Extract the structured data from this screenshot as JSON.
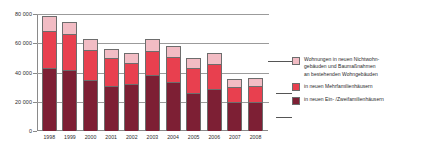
{
  "chart_data": {
    "type": "bar",
    "stacked": true,
    "title": "",
    "xlabel": "",
    "ylabel": "",
    "ylim": [
      0,
      80000
    ],
    "yticks": [
      0,
      20000,
      40000,
      60000,
      80000
    ],
    "ytick_labels": [
      "0",
      "20 000",
      "40 000",
      "60 000",
      "80 000"
    ],
    "grid": true,
    "legend_position": "right",
    "categories": [
      "1998",
      "1999",
      "2000",
      "2001",
      "2002",
      "2003",
      "2004",
      "2005",
      "2006",
      "2007",
      "2008"
    ],
    "series": [
      {
        "name": "in neuen Ein- /Zweifamilienhäusern",
        "color": "#7d1f34",
        "values": [
          43000,
          41500,
          35200,
          31000,
          32000,
          38000,
          33500,
          25700,
          28400,
          19800,
          20100
        ]
      },
      {
        "name": "in neuen Mehrfamilienhäusern",
        "color": "#e8404f",
        "values": [
          25500,
          24700,
          20500,
          18600,
          14600,
          17000,
          17000,
          17500,
          17400,
          10000,
          10400
        ]
      },
      {
        "name": "Wohnungen in neuen Nichtwohngebäuden und Baumaßnahmen an bestehenden Wohngebäuden",
        "color": "#f2bcc4",
        "values": [
          10100,
          8600,
          7300,
          6500,
          6800,
          7800,
          7800,
          6700,
          7700,
          5700,
          5800
        ]
      }
    ],
    "totals": [
      78600,
      74800,
      63000,
      56100,
      53400,
      62800,
      58300,
      49900,
      53500,
      35500,
      36300
    ]
  },
  "legend": {
    "items": [
      {
        "label": "Wohnungen in neuen Nichtwohn-\ngebäuden und Baumaßnahmen\nan bestehenden Wohngebäuden",
        "line1": "Wohnungen in neuen Nichtwohn-",
        "line2": "gebäuden und Baumaßnahmen",
        "line3": "an bestehenden Wohngebäuden",
        "color": "#f2bcc4"
      },
      {
        "label": "in neuen Mehrfamilienhäusern",
        "line1": "in neuen Mehrfamilienhäusern",
        "line2": "",
        "line3": "",
        "color": "#e8404f"
      },
      {
        "label": "in neuen Ein- /Zweifamilienhäusern",
        "line1": "in neuen Ein- /Zweifamilienhäusern",
        "line2": "",
        "line3": "",
        "color": "#7d1f34"
      }
    ]
  }
}
